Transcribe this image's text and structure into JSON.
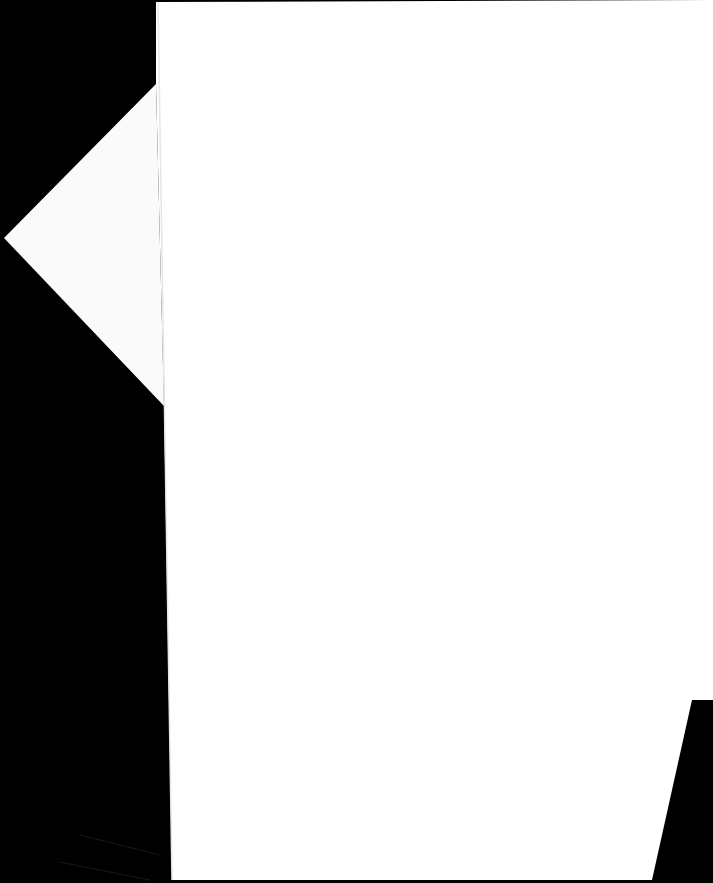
{
  "scene": {
    "description": "Blank white sheet of paper photographed on a black background",
    "colors": {
      "background": "#000000",
      "paper": "#ffffff",
      "paper_edge_shade": "#f2f2f2"
    },
    "text": []
  }
}
